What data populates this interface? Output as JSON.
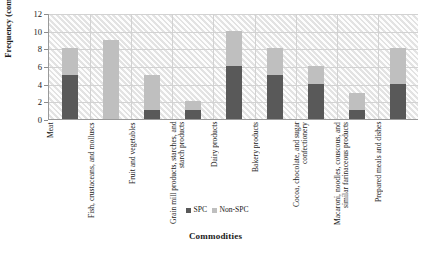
{
  "chart_data": {
    "type": "bar",
    "subtype": "stacked-bar-vertical",
    "title": "",
    "xlabel": "Commodities",
    "ylabel": "Frequency (companies)",
    "ylim": [
      0,
      12
    ],
    "yticks": [
      0,
      2,
      4,
      6,
      8,
      10,
      12
    ],
    "grid": true,
    "legend_position": "bottom-center",
    "categories": [
      "Meat",
      "Fish, crustaceans, and molluscs",
      "Fruit and vegetables",
      "Grain mill products, starches, and starch products",
      "Dairy products",
      "Bakery products",
      "Cocoa, chocolate, and sugar confectionery",
      "Macaroni, noodles, couscous, and similar farinaceous products",
      "Prepared meals and dishes"
    ],
    "series": [
      {
        "name": "SPC",
        "color": "#595959",
        "values": [
          5,
          0,
          1,
          1,
          6,
          5,
          4,
          1,
          4
        ]
      },
      {
        "name": "Non-SPC",
        "color": "#bfbfbf",
        "values": [
          3,
          9,
          4,
          1,
          4,
          3,
          2,
          2,
          4
        ]
      }
    ],
    "totals": [
      8,
      9,
      5,
      2,
      10,
      8,
      6,
      3,
      8
    ]
  },
  "legend": {
    "items": [
      {
        "label": "SPC",
        "color": "#595959"
      },
      {
        "label": "Non-SPC",
        "color": "#bfbfbf"
      }
    ]
  },
  "axes": {
    "y_tick_labels": [
      "12",
      "10",
      "8",
      "6",
      "4",
      "2",
      "0"
    ],
    "y_axis_title": "Frequency (companies)",
    "x_axis_title": "Commodities"
  }
}
